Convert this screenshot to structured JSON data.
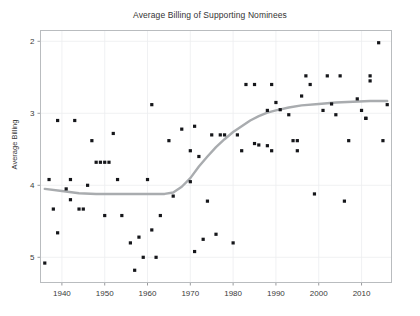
{
  "chart_data": {
    "type": "scatter",
    "title": "Average Billing of Supporting Nominees",
    "xlabel": "",
    "ylabel": "Average Billing",
    "xlim": [
      1935,
      2017
    ],
    "ylim": [
      5.35,
      1.85
    ],
    "y_inverted": true,
    "grid": true,
    "legend": false,
    "xticks": [
      1940,
      1950,
      1960,
      1970,
      1980,
      1990,
      2000,
      2010
    ],
    "xtick_labels": [
      "1940",
      "1950",
      "1960",
      "1970",
      "1980",
      "1990",
      "2000",
      "2010"
    ],
    "yticks": [
      2,
      3,
      4,
      5
    ],
    "ytick_labels": [
      "2",
      "3",
      "4",
      "5"
    ],
    "marker_color": "#15161a",
    "trend_color": "#a9acaf",
    "grid_color": "#eceef0",
    "frame_color": "#b9bcbf",
    "series": [
      {
        "name": "Supporting nominees",
        "type": "scatter",
        "points": [
          [
            1936,
            5.08
          ],
          [
            1937,
            3.92
          ],
          [
            1938,
            4.33
          ],
          [
            1939,
            3.1
          ],
          [
            1939,
            4.66
          ],
          [
            1941,
            4.05
          ],
          [
            1942,
            4.2
          ],
          [
            1942,
            3.92
          ],
          [
            1943,
            3.1
          ],
          [
            1944,
            4.33
          ],
          [
            1945,
            4.33
          ],
          [
            1946,
            4.0
          ],
          [
            1947,
            3.38
          ],
          [
            1948,
            3.68
          ],
          [
            1949,
            3.68
          ],
          [
            1950,
            3.68
          ],
          [
            1950,
            4.42
          ],
          [
            1951,
            3.68
          ],
          [
            1952,
            3.28
          ],
          [
            1953,
            3.92
          ],
          [
            1954,
            4.42
          ],
          [
            1956,
            4.8
          ],
          [
            1957,
            5.18
          ],
          [
            1958,
            4.72
          ],
          [
            1959,
            5.0
          ],
          [
            1960,
            3.92
          ],
          [
            1961,
            2.88
          ],
          [
            1961,
            4.62
          ],
          [
            1962,
            5.0
          ],
          [
            1963,
            4.42
          ],
          [
            1965,
            3.38
          ],
          [
            1966,
            4.15
          ],
          [
            1968,
            3.22
          ],
          [
            1970,
            3.52
          ],
          [
            1970,
            3.95
          ],
          [
            1971,
            3.18
          ],
          [
            1971,
            4.92
          ],
          [
            1972,
            3.6
          ],
          [
            1973,
            4.75
          ],
          [
            1974,
            4.22
          ],
          [
            1975,
            3.3
          ],
          [
            1976,
            4.68
          ],
          [
            1977,
            3.3
          ],
          [
            1978,
            3.3
          ],
          [
            1980,
            4.8
          ],
          [
            1981,
            3.3
          ],
          [
            1982,
            3.52
          ],
          [
            1983,
            2.6
          ],
          [
            1985,
            2.6
          ],
          [
            1985,
            3.42
          ],
          [
            1986,
            3.44
          ],
          [
            1988,
            2.96
          ],
          [
            1988,
            3.45
          ],
          [
            1989,
            2.6
          ],
          [
            1989,
            3.52
          ],
          [
            1990,
            2.85
          ],
          [
            1991,
            2.95
          ],
          [
            1993,
            3.02
          ],
          [
            1994,
            3.38
          ],
          [
            1995,
            3.52
          ],
          [
            1995,
            3.38
          ],
          [
            1996,
            2.76
          ],
          [
            1997,
            2.48
          ],
          [
            1998,
            2.6
          ],
          [
            1999,
            4.12
          ],
          [
            2001,
            2.96
          ],
          [
            2002,
            2.48
          ],
          [
            2003,
            2.87
          ],
          [
            2004,
            3.02
          ],
          [
            2005,
            2.48
          ],
          [
            2006,
            4.22
          ],
          [
            2007,
            3.38
          ],
          [
            2009,
            2.8
          ],
          [
            2010,
            2.96
          ],
          [
            2011,
            3.07
          ],
          [
            2011,
            3.07
          ],
          [
            2012,
            2.48
          ],
          [
            2012,
            2.55
          ],
          [
            2014,
            2.02
          ],
          [
            2015,
            3.38
          ],
          [
            2016,
            2.88
          ]
        ]
      },
      {
        "name": "LOESS trend",
        "type": "line",
        "points": [
          [
            1936,
            4.05
          ],
          [
            1940,
            4.08
          ],
          [
            1944,
            4.11
          ],
          [
            1948,
            4.12
          ],
          [
            1952,
            4.12
          ],
          [
            1956,
            4.12
          ],
          [
            1960,
            4.12
          ],
          [
            1964,
            4.12
          ],
          [
            1966,
            4.1
          ],
          [
            1968,
            4.02
          ],
          [
            1970,
            3.9
          ],
          [
            1972,
            3.74
          ],
          [
            1974,
            3.6
          ],
          [
            1976,
            3.47
          ],
          [
            1978,
            3.36
          ],
          [
            1980,
            3.26
          ],
          [
            1982,
            3.18
          ],
          [
            1984,
            3.1
          ],
          [
            1986,
            3.04
          ],
          [
            1988,
            2.99
          ],
          [
            1990,
            2.96
          ],
          [
            1993,
            2.92
          ],
          [
            1996,
            2.89
          ],
          [
            2000,
            2.87
          ],
          [
            2004,
            2.85
          ],
          [
            2008,
            2.84
          ],
          [
            2012,
            2.83
          ],
          [
            2016,
            2.83
          ]
        ]
      }
    ]
  }
}
